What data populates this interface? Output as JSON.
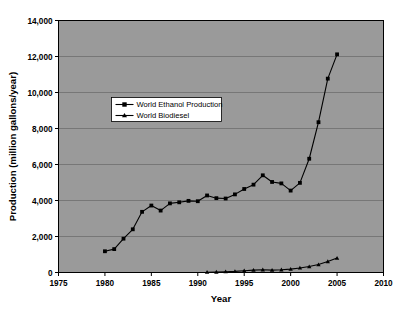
{
  "chart_data": {
    "type": "line",
    "title": "",
    "xlabel": "Year",
    "ylabel": "Production (million gallons/year)",
    "xlim": [
      1975,
      2010
    ],
    "ylim": [
      0,
      14000
    ],
    "xticks": [
      "1975",
      "1980",
      "1985",
      "1990",
      "1995",
      "2000",
      "2005",
      "2010"
    ],
    "xtick_values": [
      1975,
      1980,
      1985,
      1990,
      1995,
      2000,
      2005,
      2010
    ],
    "yticks": [
      "0",
      "2,000",
      "4,000",
      "6,000",
      "8,000",
      "10,000",
      "12,000",
      "14,000"
    ],
    "ytick_values": [
      0,
      2000,
      4000,
      6000,
      8000,
      10000,
      12000,
      14000
    ],
    "grid": "horizontal",
    "legend_position": "upper-left-inside",
    "plot_background": "#9a9a9a",
    "figure_background": "#ffffff",
    "line_color": "#000000",
    "series": [
      {
        "name": "World Ethanol Production",
        "marker": "square",
        "x": [
          1980,
          1981,
          1982,
          1983,
          1984,
          1985,
          1986,
          1987,
          1988,
          1989,
          1990,
          1991,
          1992,
          1993,
          1994,
          1995,
          1996,
          1997,
          1998,
          1999,
          2000,
          2001,
          2002,
          2003,
          2004,
          2005
        ],
        "values": [
          1180,
          1300,
          1880,
          2400,
          3370,
          3720,
          3440,
          3840,
          3900,
          3980,
          3960,
          4280,
          4130,
          4110,
          4340,
          4640,
          4880,
          5400,
          5030,
          4950,
          4550,
          4980,
          6320,
          8350,
          10770,
          12120
        ]
      },
      {
        "name": "World Biodiesel",
        "marker": "triangle",
        "x": [
          1991,
          1992,
          1993,
          1994,
          1995,
          1996,
          1997,
          1998,
          1999,
          2000,
          2001,
          2002,
          2003,
          2004,
          2005
        ],
        "values": [
          15,
          25,
          45,
          65,
          100,
          130,
          150,
          130,
          150,
          190,
          250,
          330,
          440,
          610,
          800
        ]
      }
    ]
  },
  "legend": {
    "entries": [
      {
        "label": "World Ethanol Production",
        "marker": "square"
      },
      {
        "label": "World Biodiesel",
        "marker": "triangle"
      }
    ]
  }
}
